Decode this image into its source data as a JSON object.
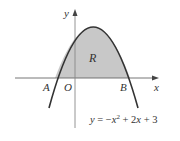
{
  "diagram": {
    "curve_equation": "y = −x² + 2x + 3",
    "eq_parts": {
      "lhs": "y",
      "eq": " = −",
      "x1": "x",
      "sup": "2",
      "mid": " + 2",
      "x2": "x",
      "end": " + 3"
    },
    "labels": {
      "x_axis": "x",
      "y_axis": "y",
      "origin": "O",
      "point_a": "A",
      "point_b": "B",
      "region": "R"
    },
    "points": {
      "A": {
        "x": -1,
        "y": 0
      },
      "B": {
        "x": 3,
        "y": 0
      },
      "vertex": {
        "x": 1,
        "y": 4
      }
    },
    "colors": {
      "curve": "#333333",
      "axis": "#666666",
      "region_fill": "#c8c8c8"
    }
  }
}
